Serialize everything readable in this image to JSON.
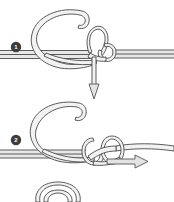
{
  "diagram": {
    "kind": "line-art knot diagram",
    "background_color": "#ffffff",
    "rope_fill_color": "#f2f2f2",
    "rope_outline_color": "#4a4a4a",
    "arrow_fill_color": "#e3e3e3",
    "arrow_outline_color": "#555555",
    "badge_color": "#3c3c3c",
    "badge_text_color": "#ffffff",
    "width": 174,
    "height": 202
  },
  "steps": [
    {
      "number": "1",
      "label": "1",
      "badge_name": "step-1-badge",
      "description": "Rope crosses the standing line forming a C-shaped bight; working end is passed through the loop and pulled downward.",
      "arrow": {
        "name": "downward-pull-arrow",
        "direction": "down",
        "style": "hollow outlined arrow"
      },
      "elements": [
        "standing-line-left",
        "standing-line-right",
        "c-shaped-bight-loop",
        "overhand-knot-crossing",
        "working-end-tail"
      ]
    },
    {
      "number": "2",
      "label": "2",
      "badge_name": "step-2-badge",
      "description": "The knot is drawn up into interlocking turns; the working end is pulled to the right to tighten.",
      "arrow": {
        "name": "rightward-pull-arrow",
        "direction": "right",
        "style": "hollow outlined arrow"
      },
      "elements": [
        "standing-line-left",
        "standing-line-right",
        "c-shaped-bight-loop",
        "interlocked-knot-turns",
        "working-end-tail"
      ]
    },
    {
      "number": "3",
      "label": "",
      "badge_name": "step-3-badge",
      "description": "Partially visible third step cropped at the bottom edge: the beginning of a new rope arc.",
      "arrow": null,
      "elements": [
        "partial-rope-arc-cropped"
      ]
    }
  ]
}
